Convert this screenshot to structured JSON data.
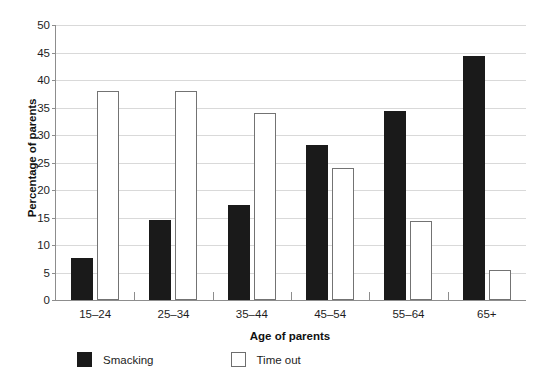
{
  "chart_data": {
    "type": "bar",
    "title": "",
    "xlabel": "Age of parents",
    "ylabel": "Percentage of parents",
    "categories": [
      "15–24",
      "25–34",
      "35–44",
      "45–54",
      "55–64",
      "65+"
    ],
    "series": [
      {
        "name": "Smacking",
        "values": [
          7.7,
          14.5,
          17.3,
          28.2,
          34.3,
          44.3
        ],
        "color": "#1a1a1a",
        "style": "filled"
      },
      {
        "name": "Time out",
        "values": [
          38.0,
          38.0,
          34.0,
          24.0,
          14.4,
          5.4
        ],
        "color": "#ffffff",
        "style": "outlined"
      }
    ],
    "ylim": [
      0,
      50
    ],
    "yticks": [
      0,
      5,
      10,
      15,
      20,
      25,
      30,
      35,
      40,
      45,
      50
    ],
    "ytick_labels": [
      "0",
      "5",
      "10",
      "15",
      "20",
      "25",
      "30",
      "35",
      "40",
      "45",
      "50"
    ],
    "grid": "horizontal",
    "legend_position": "bottom-left"
  },
  "axes": {
    "y_title": "Percentage of parents",
    "x_title": "Age of parents"
  },
  "legend": {
    "items": [
      {
        "label": "Smacking",
        "swatch": "solid-black-square"
      },
      {
        "label": "Time out",
        "swatch": "hollow-white-square"
      }
    ]
  }
}
